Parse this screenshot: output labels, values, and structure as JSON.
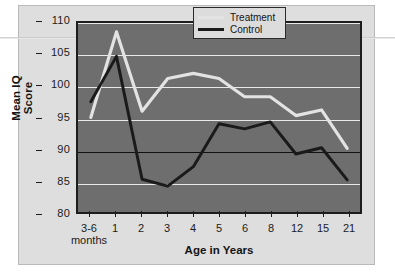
{
  "figure": {
    "background_color": "#dedede",
    "plot_background_color": "#6e6e6e",
    "frame_color": "#1d1d1d"
  },
  "chart_data": {
    "type": "line",
    "title": "",
    "xlabel": "Age in Years",
    "ylabel": "Mean IQ Score",
    "ylim": [
      80,
      110
    ],
    "ytick_labels": [
      "110",
      "105",
      "100",
      "95",
      "90",
      "85",
      "80"
    ],
    "yticks": [
      110,
      105,
      100,
      95,
      90,
      85,
      80
    ],
    "reference_line": 90,
    "grid": true,
    "grid_color": "#e9e9e9",
    "legend_position": "top-right",
    "categories": [
      "3-6 months",
      "1",
      "2",
      "3",
      "4",
      "5",
      "6",
      "8",
      "12",
      "15",
      "21"
    ],
    "category_sublabels": [
      "months",
      "",
      "",
      "",
      "",
      "",
      "",
      "",
      "",
      "",
      ""
    ],
    "category_main": [
      "3-6",
      "1",
      "2",
      "3",
      "4",
      "5",
      "6",
      "8",
      "12",
      "15",
      "21"
    ],
    "series": [
      {
        "name": "Treatment",
        "color": "#e3e3e3",
        "values": [
          95.0,
          108.6,
          96.0,
          101.2,
          102.0,
          101.2,
          98.3,
          98.3,
          95.3,
          96.2,
          90.1
        ]
      },
      {
        "name": "Control",
        "color": "#1a1a1a",
        "values": [
          97.5,
          104.7,
          85.2,
          84.1,
          87.2,
          94.0,
          93.2,
          94.3,
          89.2,
          90.2,
          85.1
        ]
      }
    ]
  },
  "legend": {
    "items": [
      {
        "label": "Treatment",
        "color": "#e3e3e3"
      },
      {
        "label": "Control",
        "color": "#1a1a1a"
      }
    ]
  },
  "axis": {
    "x_title": "Age in Years",
    "y_title": "Mean IQ Score"
  }
}
